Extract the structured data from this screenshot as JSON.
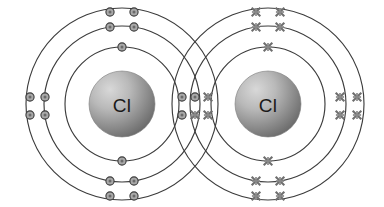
{
  "figure": {
    "type": "dot-and-cross-diagram",
    "background_color": "#ffffff",
    "shell_stroke_color": "#3c3c3c",
    "dot_fill_color": "#a8a8a8",
    "dot_stroke_color": "#3a3a3a",
    "cross_color": "#6e6e6e",
    "nucleus_label_color": "#1a1a1a",
    "nucleus_gradient_light": "#cfcfcf",
    "nucleus_gradient_dark": "#6f6f6f"
  },
  "atoms": [
    {
      "id": "left-atom",
      "element_symbol": "Cl",
      "electron_marker": "dot",
      "center_x": 122,
      "center_y": 104,
      "nucleus_radius": 33,
      "shell_radii": [
        57,
        78,
        96
      ],
      "shell_electron_counts": [
        2,
        8,
        7
      ],
      "total_electrons": 17
    },
    {
      "id": "right-atom",
      "element_symbol": "Cl",
      "electron_marker": "cross",
      "center_x": 268,
      "center_y": 104,
      "nucleus_radius": 33,
      "shell_radii": [
        57,
        78,
        96
      ],
      "shell_electron_counts": [
        2,
        8,
        7
      ],
      "total_electrons": 17
    }
  ],
  "bond": {
    "type": "single covalent bond",
    "shared_pair_count": 1,
    "shared_electrons": [
      {
        "marker": "dot",
        "x": 195,
        "y": 97
      },
      {
        "marker": "cross",
        "x": 195,
        "y": 115
      }
    ],
    "overlap_center_x": 195
  },
  "electrons": {
    "left": {
      "shell1": [
        {
          "x": 122,
          "y": 47,
          "marker": "dot"
        },
        {
          "x": 122,
          "y": 161,
          "marker": "dot"
        }
      ],
      "shell2": [
        {
          "x": 110,
          "y": 27,
          "marker": "dot"
        },
        {
          "x": 134,
          "y": 27,
          "marker": "dot"
        },
        {
          "x": 110,
          "y": 181,
          "marker": "dot"
        },
        {
          "x": 134,
          "y": 181,
          "marker": "dot"
        },
        {
          "x": 45,
          "y": 97,
          "marker": "dot"
        },
        {
          "x": 45,
          "y": 115,
          "marker": "dot"
        },
        {
          "x": 182,
          "y": 97,
          "marker": "dot"
        },
        {
          "x": 182,
          "y": 115,
          "marker": "dot"
        }
      ],
      "shell3": [
        {
          "x": 110,
          "y": 12,
          "marker": "dot"
        },
        {
          "x": 134,
          "y": 12,
          "marker": "dot"
        },
        {
          "x": 110,
          "y": 196,
          "marker": "dot"
        },
        {
          "x": 134,
          "y": 196,
          "marker": "dot"
        },
        {
          "x": 30,
          "y": 97,
          "marker": "dot"
        },
        {
          "x": 30,
          "y": 115,
          "marker": "dot"
        }
      ]
    },
    "right": {
      "shell1": [
        {
          "x": 268,
          "y": 47,
          "marker": "cross"
        },
        {
          "x": 268,
          "y": 161,
          "marker": "cross"
        }
      ],
      "shell2": [
        {
          "x": 256,
          "y": 27,
          "marker": "cross"
        },
        {
          "x": 280,
          "y": 27,
          "marker": "cross"
        },
        {
          "x": 256,
          "y": 181,
          "marker": "cross"
        },
        {
          "x": 280,
          "y": 181,
          "marker": "cross"
        },
        {
          "x": 208,
          "y": 97,
          "marker": "cross"
        },
        {
          "x": 208,
          "y": 115,
          "marker": "cross"
        },
        {
          "x": 340,
          "y": 97,
          "marker": "cross"
        },
        {
          "x": 340,
          "y": 115,
          "marker": "cross"
        }
      ],
      "shell3": [
        {
          "x": 256,
          "y": 12,
          "marker": "cross"
        },
        {
          "x": 280,
          "y": 12,
          "marker": "cross"
        },
        {
          "x": 256,
          "y": 196,
          "marker": "cross"
        },
        {
          "x": 280,
          "y": 196,
          "marker": "cross"
        },
        {
          "x": 357,
          "y": 97,
          "marker": "cross"
        },
        {
          "x": 357,
          "y": 115,
          "marker": "cross"
        }
      ]
    }
  }
}
